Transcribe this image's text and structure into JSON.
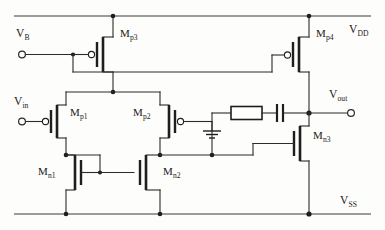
{
  "diagram": {
    "type": "analog-circuit-schematic",
    "colors": {
      "wire": "#2b2b2b",
      "device": "#1e1e1e",
      "background": "#fdfdfb"
    }
  },
  "rails": {
    "vdd_label": "V",
    "vdd_sub": "DD",
    "vss_label": "V",
    "vss_sub": "SS"
  },
  "ports": {
    "vb": {
      "label": "V",
      "sub": "B",
      "name": "bias-voltage-input"
    },
    "vin": {
      "label": "V",
      "sub": "in",
      "name": "signal-input"
    },
    "vout": {
      "label": "V",
      "sub": "out",
      "name": "signal-output"
    }
  },
  "devices": [
    {
      "id": "Mp3",
      "label": "M",
      "sub": "p3",
      "kind": "pmos"
    },
    {
      "id": "Mp4",
      "label": "M",
      "sub": "p4",
      "kind": "pmos"
    },
    {
      "id": "Mp1",
      "label": "M",
      "sub": "p1",
      "kind": "pmos"
    },
    {
      "id": "Mp2",
      "label": "M",
      "sub": "p2",
      "kind": "pmos"
    },
    {
      "id": "Mn1",
      "label": "M",
      "sub": "n1",
      "kind": "nmos"
    },
    {
      "id": "Mn2",
      "label": "M",
      "sub": "n2",
      "kind": "nmos"
    },
    {
      "id": "Mn3",
      "label": "M",
      "sub": "n3",
      "kind": "nmos"
    }
  ],
  "passives": [
    {
      "id": "Rc",
      "kind": "resistor",
      "label": ""
    },
    {
      "id": "Cc",
      "kind": "capacitor",
      "label": ""
    }
  ],
  "symbols": {
    "ground": "ground-symbol",
    "junction": "junction-dot",
    "terminal": "open-terminal-circle"
  }
}
